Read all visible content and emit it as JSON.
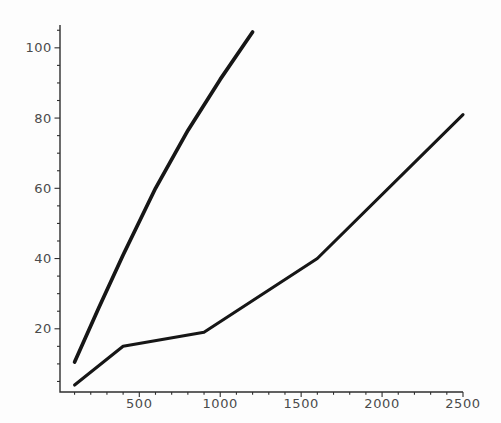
{
  "chart_data": {
    "type": "line",
    "title": "",
    "xlabel": "",
    "ylabel": "",
    "grid": "off",
    "legend": "none",
    "x_ticks": [
      500,
      1000,
      1500,
      2000,
      2500
    ],
    "y_ticks": [
      20,
      40,
      60,
      80,
      100
    ],
    "x_minor_tick_step": 100,
    "y_minor_tick_step": 5,
    "x_range": [
      10,
      2500
    ],
    "y_range": [
      2,
      106.5
    ],
    "background": "#fdfdfd",
    "line_color": "#161616",
    "axis_color": "#2e2e2e",
    "label_color": "#4b4b4b",
    "label_font_size": 13,
    "series": [
      {
        "name": "upper steep line",
        "points": [
          [
            100,
            10.5
          ],
          [
            250,
            26
          ],
          [
            400,
            41
          ],
          [
            600,
            60
          ],
          [
            800,
            76.5
          ],
          [
            1000,
            91
          ],
          [
            1200,
            104.5
          ]
        ],
        "stroke_width": 3.7
      },
      {
        "name": "lower shallow line",
        "points": [
          [
            100,
            4
          ],
          [
            400,
            15
          ],
          [
            900,
            19
          ],
          [
            1600,
            40
          ],
          [
            2500,
            81
          ]
        ],
        "stroke_width": 3.1
      }
    ]
  }
}
